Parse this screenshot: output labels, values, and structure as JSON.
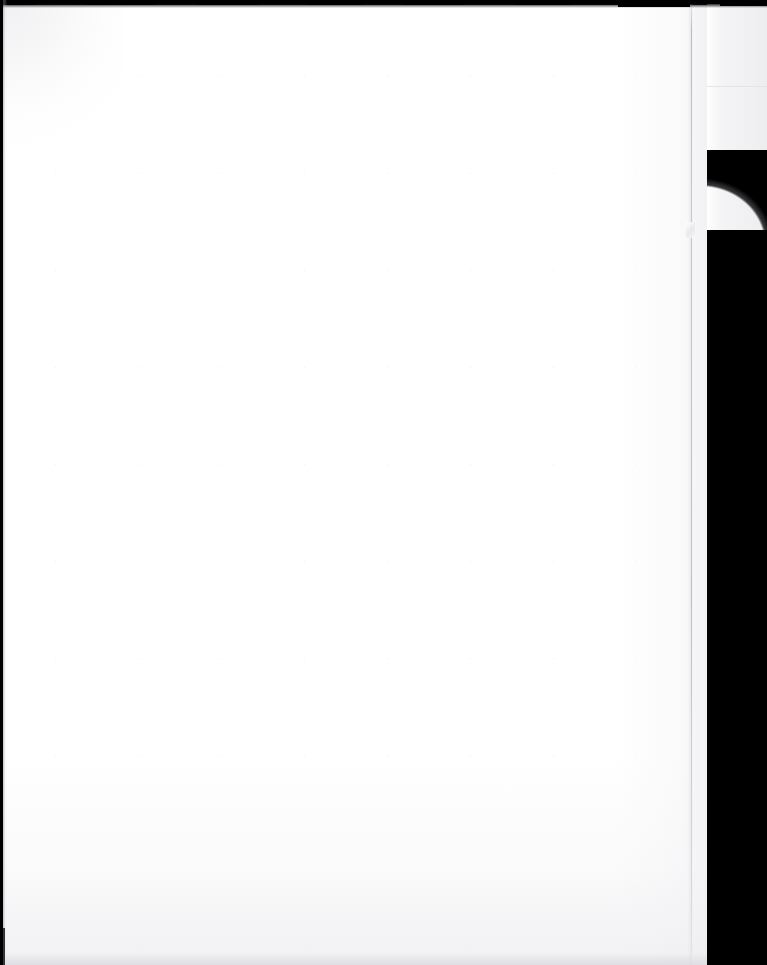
{
  "document": {
    "kind": "scanned-page",
    "page_content_text": "",
    "page_state_label": "Blank page",
    "orientation": "portrait"
  },
  "canvas": {
    "width_px": 767,
    "height_px": 965
  },
  "regions": {
    "page_sheet": {
      "name": "blank-paper-sheet",
      "color": "#ffffff",
      "left_px": 3,
      "top_px": 5,
      "width_px": 704,
      "height_px": 960
    },
    "flap_sheet": {
      "name": "underlying-sheet-flap",
      "color": "#f2f2f4",
      "left_px": 707,
      "top_px": 0,
      "width_px": 60,
      "height_px": 232
    },
    "scanner_backdrop": {
      "name": "scanner-platen-background",
      "color": "#000000"
    },
    "page_edge_line": {
      "name": "page-fold-edge",
      "color": "#b2b2ba",
      "left_px": 691
    },
    "top_edge_strip": {
      "name": "top-scan-border",
      "color": "#000000",
      "height_px": 5
    },
    "left_edge_strip": {
      "name": "left-scan-border",
      "color": "#000000",
      "width_px": 3
    }
  },
  "colors": {
    "paper_white": "#ffffff",
    "flap_gray": "#f2f2f4",
    "backdrop_black": "#000000",
    "edge_line_gray": "#b2b2ba",
    "vignette_gray": "#eeeef1"
  },
  "top_edge_segments": [
    {
      "left_px": 0,
      "width_px": 34,
      "height_px": 5
    },
    {
      "left_px": 34,
      "width_px": 52,
      "height_px": 4
    },
    {
      "left_px": 86,
      "width_px": 68,
      "height_px": 5
    },
    {
      "left_px": 154,
      "width_px": 44,
      "height_px": 4
    },
    {
      "left_px": 198,
      "width_px": 60,
      "height_px": 5
    },
    {
      "left_px": 258,
      "width_px": 48,
      "height_px": 4
    },
    {
      "left_px": 306,
      "width_px": 56,
      "height_px": 5
    },
    {
      "left_px": 362,
      "width_px": 40,
      "height_px": 4
    },
    {
      "left_px": 402,
      "width_px": 62,
      "height_px": 5
    },
    {
      "left_px": 464,
      "width_px": 50,
      "height_px": 4
    },
    {
      "left_px": 514,
      "width_px": 58,
      "height_px": 5
    },
    {
      "left_px": 572,
      "width_px": 46,
      "height_px": 4
    },
    {
      "left_px": 618,
      "width_px": 72,
      "height_px": 7
    },
    {
      "left_px": 690,
      "width_px": 30,
      "height_px": 4
    },
    {
      "left_px": 720,
      "width_px": 47,
      "height_px": 6
    }
  ]
}
